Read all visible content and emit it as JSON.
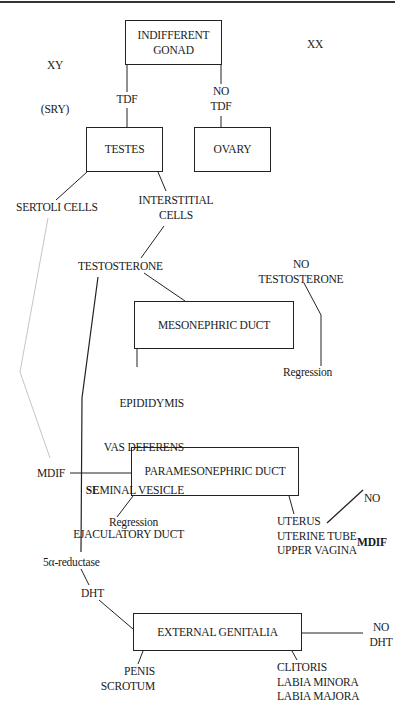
{
  "diagram": {
    "type": "flowchart",
    "genotypes": {
      "male_line1": "XY",
      "male_line2": "(SRY)",
      "female": "XX"
    },
    "boxes": {
      "indifferent_gonad": "INDIFFERENT\nGONAD",
      "testes": "TESTES",
      "ovary": "OVARY",
      "mesonephric_duct": "MESONEPHRIC DUCT",
      "paramesonephric_duct": "PARAMESONEPHRIC DUCT",
      "external_genitalia": "EXTERNAL GENITALIA"
    },
    "labels": {
      "tdf": "TDF",
      "no_tdf": "NO\nTDF",
      "sertoli_cells": "SERTOLI CELLS",
      "interstitial_cells": "INTERSTITIAL\nCELLS",
      "testosterone": "TESTOSTERONE",
      "no_testosterone": "NO\nTESTOSTERONE",
      "regression_mesonephric": "Regression",
      "mesonephric_derivatives": [
        "EPIDIDYMIS",
        "VAS DEFERENS",
        "SEMINAL VESICLE",
        "EJACULATORY DUCT"
      ],
      "seminal_prefix": "SE",
      "seminal_rest": "MINAL VESICLE",
      "mdif": "MDIF",
      "no_mdif_line1": "NO",
      "no_mdif_line2": "MDIF",
      "regression_paramesonephric": "Regression",
      "paramesonephric_derivatives": "UTERUS\nUTERINE TUBE\nUPPER VAGINA",
      "five_alpha_reductase": "5α-reductase",
      "dht": "DHT",
      "no_dht": "NO\nDHT",
      "male_genitalia": "PENIS\nSCROTUM",
      "female_genitalia": "CLITORIS\nLABIA MINORA\nLABIA MAJORA"
    },
    "colors": {
      "line": "#222222",
      "faint_line": "#b5b5b5",
      "background": "#ffffff"
    }
  }
}
